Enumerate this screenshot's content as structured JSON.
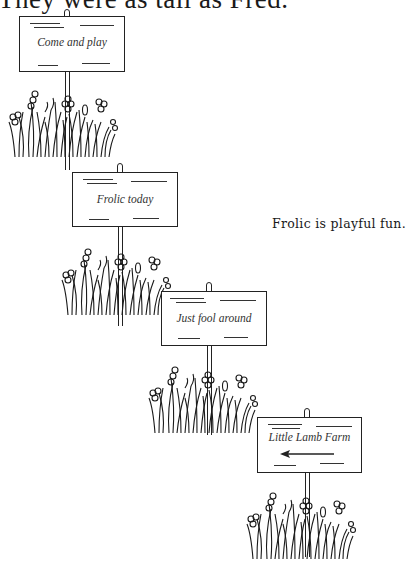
{
  "caption": "They were as tall as Fred.",
  "side_note": "Frolic is playful fun.",
  "signs": [
    {
      "text": "Come and play",
      "arrow": false
    },
    {
      "text": "Frolic today",
      "arrow": false
    },
    {
      "text": "Just fool around",
      "arrow": false
    },
    {
      "text": "Little Lamb Farm",
      "arrow": true,
      "arrow_direction": "left"
    }
  ]
}
